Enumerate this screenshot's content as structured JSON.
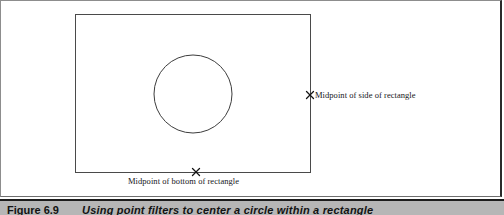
{
  "figure": {
    "caption_number": "Figure 6.9",
    "caption_text": "Using point filters to center a circle within a rectangle",
    "panel_background": "#ffffff",
    "caption_bar_color": "#b6b6b6",
    "line_color": "#3a3a3a"
  },
  "diagram": {
    "type": "line-art",
    "rectangle": {
      "name": "outer rectangle",
      "x": 75,
      "y": 14,
      "width": 235,
      "height": 158,
      "stroke": "#4a4a4a"
    },
    "circle": {
      "name": "centered circle",
      "cx": 193,
      "cy": 94,
      "r": 39,
      "stroke": "#3d3d3d"
    },
    "markers": [
      {
        "id": "midpoint-side",
        "glyph": "x-marker",
        "x": 310,
        "y": 95,
        "label": "Midpoint of side of rectangle"
      },
      {
        "id": "midpoint-bottom",
        "glyph": "x-marker",
        "x": 196,
        "y": 172,
        "label": "Midpoint of bottom of rectangle"
      }
    ]
  },
  "labels": {
    "side": "Midpoint of side of rectangle",
    "bottom": "Midpoint of bottom of rectangle"
  }
}
